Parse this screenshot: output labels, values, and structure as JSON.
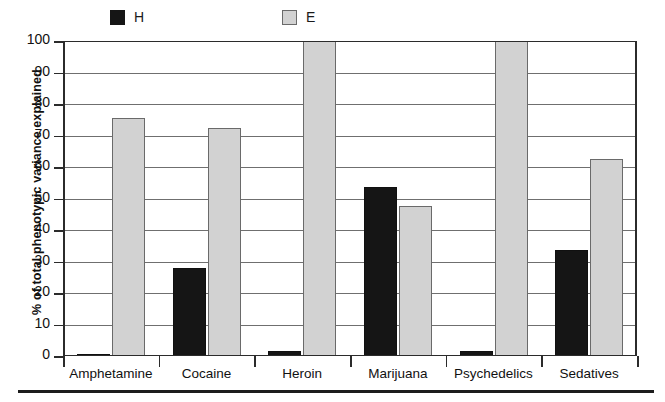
{
  "chart_data": {
    "type": "bar",
    "title": "",
    "subtitle": "",
    "xlabel": "",
    "ylabel": "% of total phenotypic variance explained",
    "ylim": [
      0,
      100
    ],
    "ytick_labels": [
      "0",
      "10",
      "20",
      "30",
      "40",
      "50",
      "60",
      "70",
      "80",
      "90",
      "100"
    ],
    "ytick_values": [
      0,
      10,
      20,
      30,
      40,
      50,
      60,
      70,
      80,
      90,
      100
    ],
    "grid": "horizontal",
    "legend_position": "top",
    "categories": [
      "Amphetamine",
      "Cocaine",
      "Heroin",
      "Marijuana",
      "Psychedelics",
      "Sedatives"
    ],
    "series": [
      {
        "name": "H",
        "color": "#151515",
        "values": [
          0.5,
          28,
          1.5,
          53.5,
          1.5,
          33.5
        ]
      },
      {
        "name": "E",
        "color": "#d2d2d2",
        "values": [
          75.5,
          72.5,
          100,
          47.5,
          100,
          62.5
        ]
      }
    ]
  },
  "legend": {
    "items": [
      {
        "label": "H",
        "swatch": "black-square-swatch"
      },
      {
        "label": "E",
        "swatch": "gray-square-swatch"
      }
    ]
  },
  "axes": {
    "y_title": "% of total phenotypic variance explained"
  }
}
